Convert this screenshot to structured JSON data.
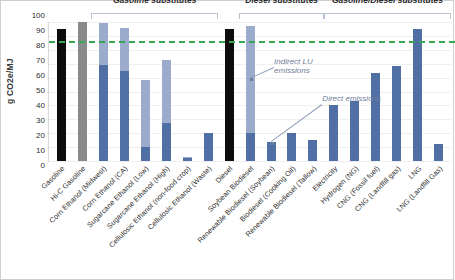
{
  "chart_data": {
    "type": "bar",
    "title": "",
    "xlabel": "",
    "ylabel": "g CO2e/MJ",
    "ylim": [
      0,
      100
    ],
    "yticks": [
      100,
      90,
      80,
      70,
      60,
      50,
      40,
      30,
      20,
      10,
      0
    ],
    "grid": true,
    "legend": "none",
    "stacked": true,
    "categories": [
      "Gasoline",
      "Hi-C Gasoline",
      "Corn Ethanol (Midwest)",
      "Corn Ethanol (CA)",
      "Sugarcane Ethanol (Low)",
      "Sugarcane Ethanol (High)",
      "Cellulosic Ethanol (non-food crop)",
      "Cellulosic Ethanol (Waste)",
      "Diesel",
      "Soybean Biodiesel",
      "Renewable Biodiesel (Soybean)",
      "Biodiesel (Cooking Oil)",
      "Renewable Biodiesel (Tallow)",
      "Electricity",
      "Hydrogen (NG)",
      "CNG (Fossil fuel)",
      "CNG (Landfill gas)",
      "LNG",
      "LNG (Landfill Gas)"
    ],
    "series": [
      {
        "name": "Direct emissions",
        "values": [
          95,
          100,
          69,
          65,
          10,
          27,
          2,
          20,
          95,
          20,
          14,
          20,
          15,
          40,
          43,
          63,
          68,
          95,
          12
        ]
      },
      {
        "name": "Indirect LU emissions",
        "values": [
          0,
          0,
          30,
          31,
          48,
          46,
          1,
          0,
          0,
          77,
          0,
          0,
          0,
          0,
          0,
          0,
          0,
          0,
          0
        ]
      }
    ],
    "totals": [
      95,
      100,
      99,
      96,
      58,
      73,
      3,
      20,
      95,
      97,
      14,
      20,
      15,
      40,
      43,
      63,
      68,
      95,
      12
    ],
    "bar_styles": [
      "solid-black",
      "solid-gray",
      "stacked",
      "stacked",
      "stacked",
      "stacked",
      "stacked",
      "stacked",
      "solid-black",
      "stacked",
      "stacked",
      "stacked",
      "stacked",
      "stacked",
      "stacked",
      "stacked",
      "stacked",
      "stacked",
      "stacked"
    ],
    "threshold": {
      "value": 86,
      "label": "",
      "color": "#35a853",
      "style": "dashed"
    },
    "groups": [
      {
        "label": "Gasoline substitutes",
        "start_index": 2,
        "end_index": 7
      },
      {
        "label": "Diesel substitutes",
        "start_index": 9,
        "end_index": 12
      },
      {
        "label": "Gasoline/Diesel substitutes",
        "start_index": 13,
        "end_index": 18
      }
    ],
    "annotations": [
      {
        "text": "Indirect LU\nemissions",
        "target_index": 9,
        "target_value": 60
      },
      {
        "text": "Direct emissions",
        "target_index": 10,
        "target_value": 14
      }
    ],
    "colors": {
      "indirect": "#9aabcc",
      "direct": "#4f6fa5",
      "fossil_black": "#0d0d0d",
      "fossil_gray": "#888a8c",
      "threshold": "#35a853",
      "grid": "#efefef",
      "annotation_text": "#6f8099"
    }
  }
}
